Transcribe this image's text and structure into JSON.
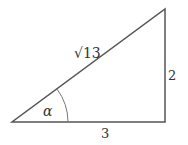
{
  "diagram": {
    "type": "right-triangle",
    "colors": {
      "stroke": "#555555",
      "text": "#333333",
      "background": "#ffffff"
    },
    "vertices": {
      "bottom_left": [
        12,
        122
      ],
      "bottom_right": [
        165,
        122
      ],
      "top_right": [
        165,
        9
      ]
    },
    "labels": {
      "hypotenuse": "√13",
      "vertical_side": "2",
      "base": "3",
      "angle": "α"
    }
  }
}
